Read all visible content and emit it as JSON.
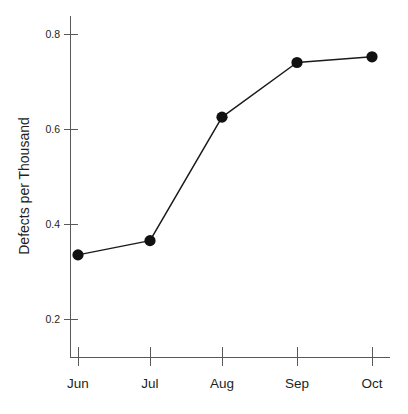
{
  "chart_data": {
    "type": "line",
    "title": "",
    "subtitle": "",
    "xlabel": "",
    "ylabel": "Defects per Thousand",
    "categories": [
      "Jun",
      "Jul",
      "Aug",
      "Sep",
      "Oct"
    ],
    "values": [
      0.335,
      0.365,
      0.625,
      0.74,
      0.752
    ],
    "series": [
      {
        "name": "Defects per Thousand",
        "values": [
          0.335,
          0.365,
          0.625,
          0.74,
          0.752
        ]
      }
    ],
    "y_ticks": [
      "0.2",
      "0.4",
      "0.6",
      "0.8"
    ],
    "y_tick_values": [
      0.2,
      0.4,
      0.6,
      0.8
    ],
    "ylim": [
      0.14,
      0.8
    ],
    "grid": false,
    "legend": false,
    "legend_position": "none",
    "marker": "filled-circle",
    "line_color": "#1a1a1a",
    "marker_color": "#111111",
    "axis_color": "#58595b",
    "background_color": "#ffffff"
  },
  "axes": {
    "y_title": "Defects per Thousand",
    "y_tick_labels": [
      "0.8",
      "0.6",
      "0.4",
      "0.2"
    ],
    "x_tick_labels": [
      "Jun",
      "Jul",
      "Aug",
      "Sep",
      "Oct"
    ]
  }
}
